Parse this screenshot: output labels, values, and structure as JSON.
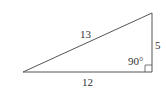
{
  "diagram": {
    "type": "right-triangle",
    "labels": {
      "hypotenuse": "13",
      "vertical_leg": "5",
      "horizontal_leg": "12",
      "right_angle": "90°"
    },
    "stroke_color": "#555555",
    "text_color": "#333333"
  }
}
